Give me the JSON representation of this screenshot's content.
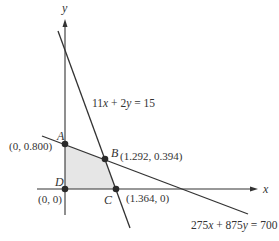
{
  "diagram": {
    "type": "linear-programming-feasible-region",
    "axes": {
      "x_label": "x",
      "y_label": "y"
    },
    "lines": [
      {
        "id": "steep",
        "equation": "11x + 2y = 15",
        "eq_parts": [
          "11",
          "x",
          " + 2",
          "y",
          " = 15"
        ]
      },
      {
        "id": "shallow",
        "equation": "275x + 875y = 700",
        "eq_parts": [
          "275",
          "x",
          " + 875",
          "y",
          " = 700"
        ]
      }
    ],
    "vertices": [
      {
        "name": "A",
        "coord": "(0, 0.800)"
      },
      {
        "name": "B",
        "coord": "(1.292, 0.394)"
      },
      {
        "name": "C",
        "coord": "(1.364, 0)"
      },
      {
        "name": "D",
        "coord": "(0, 0)"
      }
    ],
    "colors": {
      "line": "#333333",
      "region_fill": "#e6e6e6",
      "point": "#2a2a2a"
    }
  }
}
